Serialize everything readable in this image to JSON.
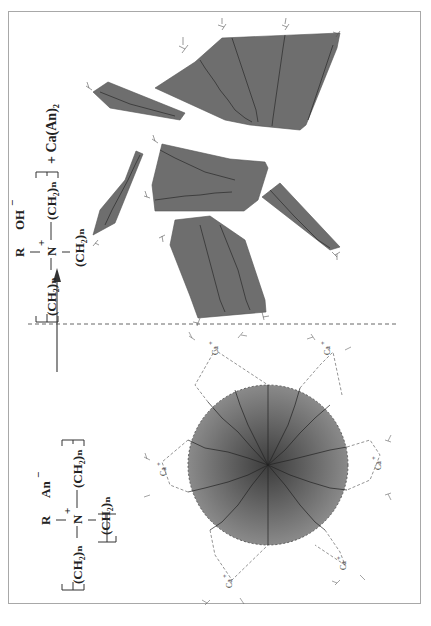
{
  "figure": {
    "orientation": "rotated 90 degrees counter-clockwise",
    "frame_color": "#a8a8a8",
    "fill_color": "#6e6e6e",
    "micelle_gradient": [
      "#3c3c3c",
      "#8a8a8a"
    ]
  },
  "before": {
    "formula": {
      "substituent": "R",
      "counter_ion": "An",
      "counter_ion_charge": "−",
      "center_atom": "N",
      "center_charge": "+",
      "left_chain": "(CH₂)ₙ",
      "right_chain": "(CH₂)ₙ",
      "lower_chain": "(CH₂)ₙ"
    },
    "structure": "spherical micelle",
    "ion_label": "Ca",
    "ion_charge": "+",
    "ion_count": 6
  },
  "divider": {
    "style": "dashed",
    "arrow": "reaction-arrow"
  },
  "after": {
    "formula": {
      "substituent": "R",
      "counter_ion": "OH",
      "counter_ion_charge": "−",
      "center_atom": "N",
      "center_charge": "+",
      "left_chain": "(CH₂)ₙ",
      "right_chain": "(CH₂)ₙ",
      "lower_chain": "(CH₂)ₙ"
    },
    "byproduct": "+ Ca(An)₂",
    "structure": "fragmented lamellar aggregates",
    "fragment_count": 6
  }
}
